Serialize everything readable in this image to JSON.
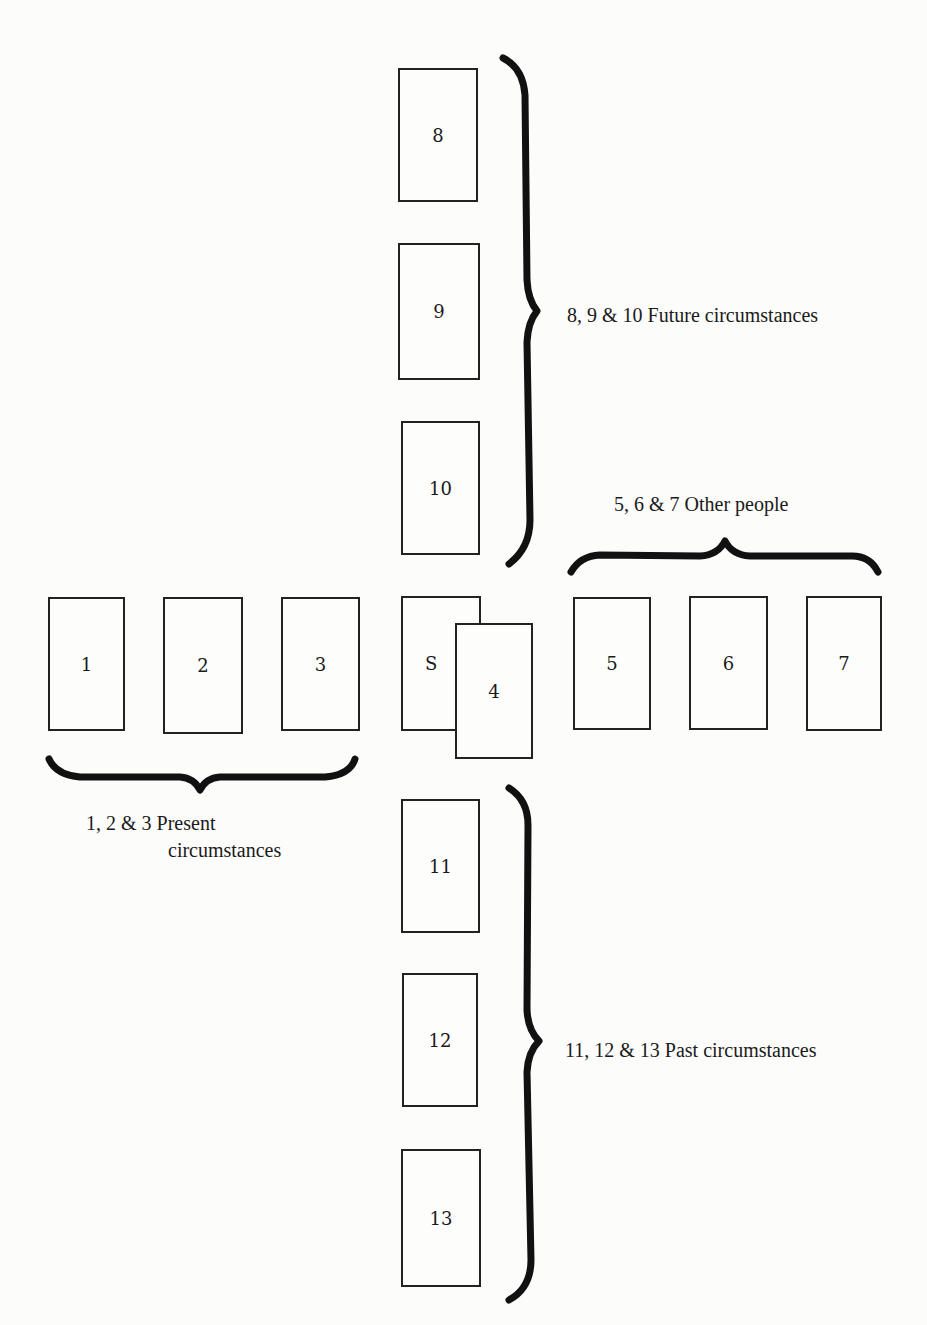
{
  "diagram": {
    "type": "tarot-card-spread",
    "cards": [
      {
        "id": "8",
        "label": "8"
      },
      {
        "id": "9",
        "label": "9"
      },
      {
        "id": "10",
        "label": "10"
      },
      {
        "id": "1",
        "label": "1"
      },
      {
        "id": "2",
        "label": "2"
      },
      {
        "id": "3",
        "label": "3"
      },
      {
        "id": "S",
        "label": "S"
      },
      {
        "id": "4",
        "label": "4"
      },
      {
        "id": "5",
        "label": "5"
      },
      {
        "id": "6",
        "label": "6"
      },
      {
        "id": "7",
        "label": "7"
      },
      {
        "id": "11",
        "label": "11"
      },
      {
        "id": "12",
        "label": "12"
      },
      {
        "id": "13",
        "label": "13"
      }
    ],
    "groups": {
      "future": {
        "cards": [
          "8",
          "9",
          "10"
        ],
        "label": "8, 9 & 10 Future circumstances"
      },
      "others": {
        "cards": [
          "5",
          "6",
          "7"
        ],
        "label": "5, 6 & 7 Other people"
      },
      "present": {
        "cards": [
          "1",
          "2",
          "3"
        ],
        "label_line1": "1, 2 & 3 Present",
        "label_line2": "circumstances"
      },
      "past": {
        "cards": [
          "11",
          "12",
          "13"
        ],
        "label": "11, 12 & 13 Past circumstances"
      }
    },
    "colors": {
      "ink": "#1a1a1a",
      "paper": "#fcfcfb"
    }
  }
}
